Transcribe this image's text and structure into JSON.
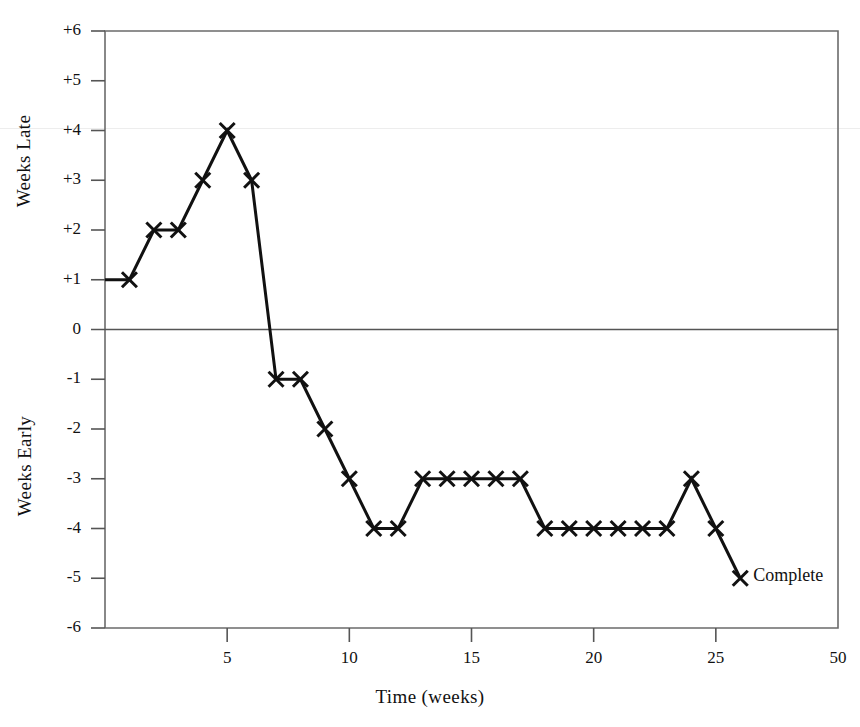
{
  "chart_data": {
    "type": "line",
    "title": "",
    "xlabel": "Time (weeks)",
    "ylabel_upper": "Weeks Late",
    "ylabel_lower": "Weeks Early",
    "x": [
      1,
      2,
      3,
      4,
      5,
      6,
      7,
      8,
      9,
      10,
      11,
      12,
      13,
      14,
      15,
      16,
      17,
      18,
      19,
      20,
      21,
      22,
      23,
      24,
      25,
      26
    ],
    "values": [
      1,
      2,
      2,
      3,
      4,
      3,
      -1,
      -1,
      -2,
      -3,
      -4,
      -4,
      -3,
      -3,
      -3,
      -3,
      -3,
      -4,
      -4,
      -4,
      -4,
      -4,
      -4,
      -3,
      -4,
      -5
    ],
    "series": [
      {
        "name": "Schedule variance",
        "marker": "x",
        "values": [
          1,
          2,
          2,
          3,
          4,
          3,
          -1,
          -1,
          -2,
          -3,
          -4,
          -4,
          -3,
          -3,
          -3,
          -3,
          -3,
          -4,
          -4,
          -4,
          -4,
          -4,
          -4,
          -3,
          -4,
          -5
        ]
      }
    ],
    "xlim": [
      0,
      30
    ],
    "ylim": [
      -6,
      6
    ],
    "xticks": [
      5,
      10,
      15,
      20,
      25,
      30
    ],
    "xtick_labels": [
      "5",
      "10",
      "15",
      "20",
      "25",
      "50"
    ],
    "yticks": [
      6,
      5,
      4,
      3,
      2,
      1,
      0,
      -1,
      -2,
      -3,
      -4,
      -5,
      -6
    ],
    "ytick_labels": [
      "+6",
      "+5",
      "+4",
      "+3",
      "+2",
      "+1",
      "0",
      "-1",
      "-2",
      "-3",
      "-4",
      "-5",
      "-6"
    ],
    "grid": false,
    "zero_line": true,
    "legend": "none",
    "annotations": [
      {
        "text": "Complete",
        "x": 26,
        "y": -5
      }
    ],
    "colors": {
      "line": "#111111",
      "marker": "#111111",
      "axis": "#555555",
      "frame": "#6b6b6b",
      "background": "#ffffff"
    }
  }
}
